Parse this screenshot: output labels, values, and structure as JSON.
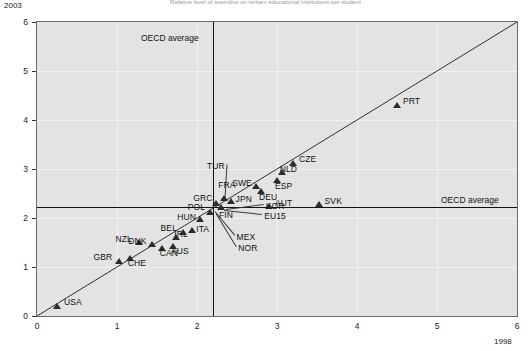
{
  "chart_data": {
    "type": "scatter",
    "title": "Relative level of spending on tertiary educational institutions per student",
    "xlabel": "1998",
    "ylabel": "2003",
    "xlim": [
      0,
      6
    ],
    "ylim": [
      0,
      6
    ],
    "xticks": [
      0,
      1,
      2,
      3,
      4,
      5,
      6
    ],
    "yticks": [
      0,
      1,
      2,
      3,
      4,
      5,
      6
    ],
    "grid": true,
    "legend": "none",
    "reference_lines": [
      {
        "name": "OECD average (1998)",
        "orientation": "vertical",
        "value": 2.2,
        "label": "OECD average"
      },
      {
        "name": "OECD average (2003)",
        "orientation": "horizontal",
        "value": 2.23,
        "label": "OECD average"
      }
    ],
    "diagonal_line": {
      "name": "45-degree parity line",
      "from": [
        0,
        0
      ],
      "to": [
        6,
        6
      ]
    },
    "points": [
      {
        "code": "USA",
        "x": 0.25,
        "y": 0.2,
        "label_dx": 7,
        "label_dy": -4,
        "marker": true
      },
      {
        "code": "GBR",
        "x": 1.02,
        "y": 1.12,
        "label_dx": -25,
        "label_dy": -4,
        "marker": true
      },
      {
        "code": "CHE",
        "x": 1.16,
        "y": 1.18,
        "label_dx": -2,
        "label_dy": 5,
        "marker": true
      },
      {
        "code": "NZL",
        "x": 1.28,
        "y": 1.5,
        "label_dx": -24,
        "label_dy": -4,
        "marker": true
      },
      {
        "code": "DNK",
        "x": 1.44,
        "y": 1.45,
        "label_dx": -24,
        "label_dy": -4,
        "marker": true
      },
      {
        "code": "CAN",
        "x": 1.56,
        "y": 1.38,
        "label_dx": -2,
        "label_dy": 5,
        "marker": true
      },
      {
        "code": "AUS",
        "x": 1.7,
        "y": 1.42,
        "label_dx": -2,
        "label_dy": 5,
        "marker": true
      },
      {
        "code": "IRL",
        "x": 1.74,
        "y": 1.6,
        "label_dx": -2,
        "label_dy": -4,
        "marker": true
      },
      {
        "code": "BEL",
        "x": 1.82,
        "y": 1.7,
        "label_dx": -22,
        "label_dy": -5,
        "marker": true
      },
      {
        "code": "ITA",
        "x": 1.94,
        "y": 1.74,
        "label_dx": 4,
        "label_dy": -2,
        "marker": true
      },
      {
        "code": "HUN",
        "x": 2.04,
        "y": 1.96,
        "label_dx": -23,
        "label_dy": -3,
        "marker": true
      },
      {
        "code": "POL",
        "x": 2.16,
        "y": 2.12,
        "label_dx": -22,
        "label_dy": -5,
        "marker": true
      },
      {
        "code": "GRC",
        "x": 2.24,
        "y": 2.3,
        "label_dx": -23,
        "label_dy": -5,
        "marker": true
      },
      {
        "code": "FRA",
        "x": 2.34,
        "y": 2.4,
        "label_dx": -6,
        "label_dy": -13,
        "marker": true
      },
      {
        "code": "JPN",
        "x": 2.42,
        "y": 2.34,
        "label_dx": 5,
        "label_dy": -2,
        "marker": true
      },
      {
        "code": "FIN",
        "x": 2.3,
        "y": 2.21,
        "label_dx": -2,
        "label_dy": 7,
        "marker": true
      },
      {
        "code": "TUR",
        "x": 2.35,
        "y": 2.41,
        "label_dx": -18,
        "label_dy": -32,
        "marker": false
      },
      {
        "code": "SWE",
        "x": 2.74,
        "y": 2.64,
        "label_dx": -24,
        "label_dy": -4,
        "marker": true
      },
      {
        "code": "DEU",
        "x": 2.8,
        "y": 2.54,
        "label_dx": -2,
        "label_dy": 5,
        "marker": true
      },
      {
        "code": "ESP",
        "x": 3.0,
        "y": 2.76,
        "label_dx": -2,
        "label_dy": 5,
        "marker": true
      },
      {
        "code": "NLD",
        "x": 3.06,
        "y": 2.92,
        "label_dx": -2,
        "label_dy": -4,
        "marker": true
      },
      {
        "code": "CZE",
        "x": 3.2,
        "y": 3.12,
        "label_dx": 6,
        "label_dy": -4,
        "marker": true
      },
      {
        "code": "AUT",
        "x": 2.9,
        "y": 2.24,
        "label_dx": 6,
        "label_dy": -3,
        "marker": true
      },
      {
        "code": "SVK",
        "x": 3.52,
        "y": 2.28,
        "label_dx": 6,
        "label_dy": -3,
        "marker": true
      },
      {
        "code": "PRT",
        "x": 4.5,
        "y": 4.3,
        "label_dx": 6,
        "label_dy": -4,
        "marker": true
      },
      {
        "code": "KOR",
        "x": 2.36,
        "y": 2.18,
        "label_dx": 40,
        "label_dy": -3,
        "marker": false
      },
      {
        "code": "EU15",
        "x": 2.34,
        "y": 2.16,
        "label_dx": 40,
        "label_dy": 6,
        "marker": false
      },
      {
        "code": "MEX",
        "x": 2.22,
        "y": 2.14,
        "label_dx": 22,
        "label_dy": 26,
        "marker": false
      },
      {
        "code": "NOR",
        "x": 2.24,
        "y": 2.1,
        "label_dx": 22,
        "label_dy": 35,
        "marker": false
      }
    ]
  },
  "axes": {
    "y_corner_label": "2003",
    "x_corner_label": "1998"
  }
}
